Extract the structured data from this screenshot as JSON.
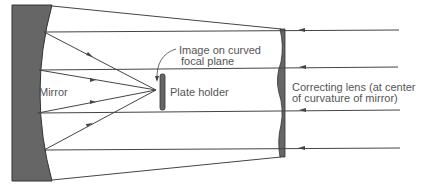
{
  "diagram": {
    "labels": {
      "mirror": "Mirror",
      "plate_holder": "Plate holder",
      "image_line1": "Image on curved",
      "image_line2": "focal plane",
      "lens_line1": "Correcting lens (at center",
      "lens_line2": "of curvature of mirror)"
    },
    "colors": {
      "line": "#444444",
      "fill": "#666666",
      "text": "#555555"
    }
  }
}
